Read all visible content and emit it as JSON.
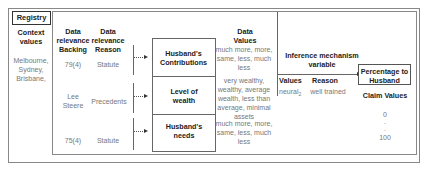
{
  "registry_label": "Registry",
  "context": {
    "header": "Context values",
    "values": "Melbourne, Sydney, Brisbane,"
  },
  "columns": {
    "backing_header": "Data relevance Backing",
    "reason_header": "Data relevance Reason",
    "data_values_header": "Data Values",
    "inference_header": "Inference mechanism variable",
    "values_header": "Values",
    "reason2_header": "Reason",
    "claim_header": "Claim Values"
  },
  "rows": [
    {
      "backing": "79(4)",
      "reason": "Statute",
      "factor": "Husband's Contributions",
      "values": "much more, more, same, less, much less"
    },
    {
      "backing": "Lee Steere",
      "reason": "Precedents",
      "factor": "Level of wealth",
      "values": "very wealthy, wealthy, average wealth, less than average, minimal assets"
    },
    {
      "backing": "75(4)",
      "reason": "Statute",
      "factor": "Husband's needs",
      "values": "much more, more, same, less, much less"
    }
  ],
  "inference": {
    "value": "neural",
    "value_sub": "2",
    "reason": "well trained"
  },
  "claim": {
    "label": "Percentage to Husband",
    "values": [
      "0",
      ".",
      ".",
      "100"
    ]
  }
}
